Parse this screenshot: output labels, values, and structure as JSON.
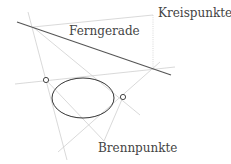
{
  "labels": {
    "ferngerade": "Ferngerade",
    "kreispunkte": "Kreispunkte",
    "brennpunkte": "Brennpunkte"
  },
  "colors": {
    "line_light": "#c8c8c8",
    "line_dark": "#555555",
    "ellipse": "#333333",
    "text": "#444444"
  }
}
